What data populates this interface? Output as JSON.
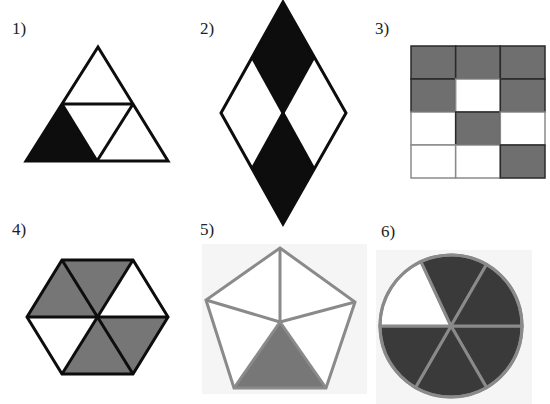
{
  "colors": {
    "black": "#0d0d0d",
    "dark_gray": "#3a3a3a",
    "mid_gray": "#7a7a7a",
    "light_outline": "#8c8c8c",
    "white": "#ffffff"
  },
  "figures": [
    {
      "label": "1)",
      "shape": "triangle",
      "parts": 4,
      "shaded_parts": 1,
      "shaded_description": "bottom-left small triangle",
      "fill": "black"
    },
    {
      "label": "2)",
      "shape": "rhombus",
      "parts": 4,
      "shaded_parts": 2,
      "shaded_description": "top and bottom sub-rhombi",
      "fill": "black"
    },
    {
      "label": "3)",
      "shape": "rectangle grid",
      "rows": 4,
      "cols": 3,
      "parts": 12,
      "shaded_parts": 7,
      "shaded_cells": [
        [
          1,
          1,
          1
        ],
        [
          1,
          0,
          1
        ],
        [
          0,
          1,
          0
        ],
        [
          0,
          0,
          1
        ]
      ],
      "fill": "gray"
    },
    {
      "label": "4)",
      "shape": "hexagon",
      "parts": 6,
      "shaded_parts": 4,
      "shaded_sectors": [
        1,
        1,
        0,
        1,
        1,
        0
      ],
      "fill": "gray"
    },
    {
      "label": "5)",
      "shape": "pentagon",
      "parts": 5,
      "shaded_parts": 1,
      "shaded_description": "bottom triangle",
      "fill": "gray"
    },
    {
      "label": "6)",
      "shape": "circle",
      "parts": 6,
      "shaded_parts": 5,
      "shaded_description": "all sectors except upper-left",
      "fill": "dark gray"
    }
  ]
}
